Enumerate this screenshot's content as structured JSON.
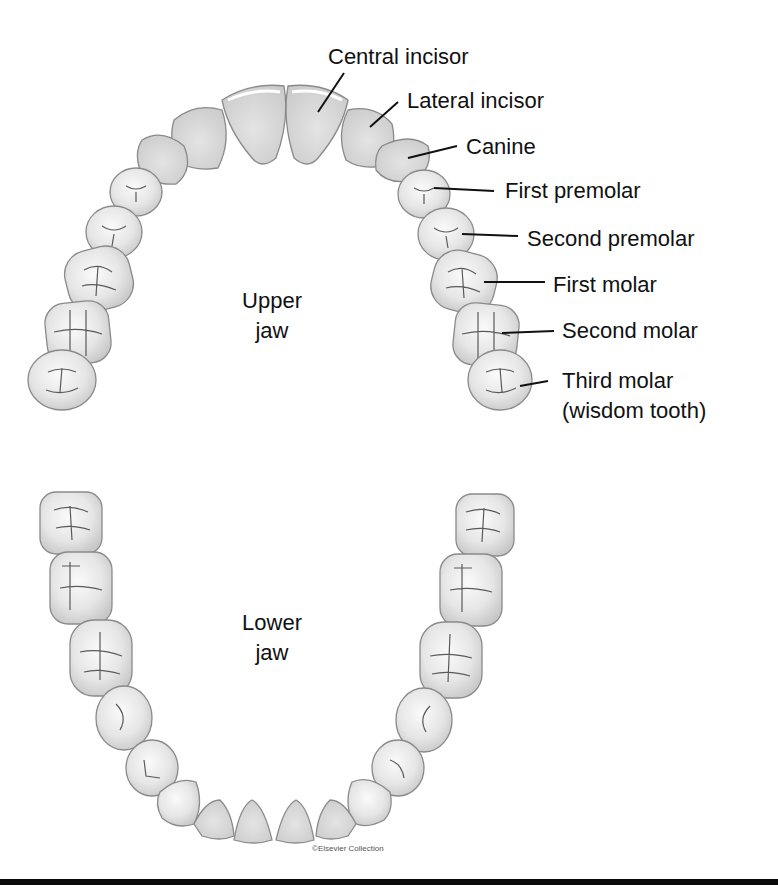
{
  "figure": {
    "upper_jaw_label": [
      "Upper",
      "jaw"
    ],
    "lower_jaw_label": [
      "Lower",
      "jaw"
    ],
    "credit": "©Elsevier Collection",
    "colors": {
      "tooth_fill": "#ececec",
      "tooth_shade": "#cfcfcf",
      "tooth_outline": "#8a8a8a",
      "groove": "#5a5a5a",
      "text": "#111111",
      "rule": "#0a0a0a"
    }
  },
  "labels": [
    {
      "id": "central-incisor",
      "text": "Central incisor"
    },
    {
      "id": "lateral-incisor",
      "text": "Lateral incisor"
    },
    {
      "id": "canine",
      "text": "Canine"
    },
    {
      "id": "first-premolar",
      "text": "First premolar"
    },
    {
      "id": "second-premolar",
      "text": "Second premolar"
    },
    {
      "id": "first-molar",
      "text": "First molar"
    },
    {
      "id": "second-molar",
      "text": "Second molar"
    },
    {
      "id": "third-molar",
      "text": "Third molar"
    },
    {
      "id": "third-molar-note",
      "text": "(wisdom tooth)"
    }
  ]
}
